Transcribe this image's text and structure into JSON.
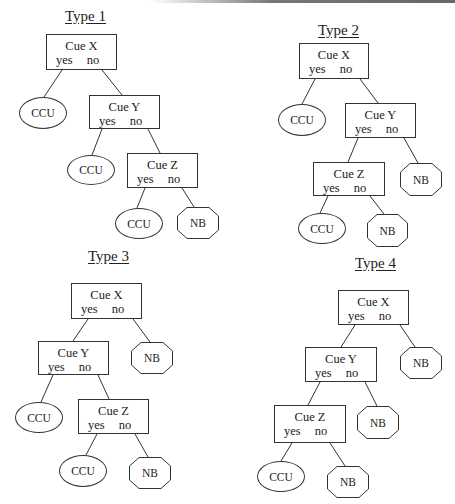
{
  "trees": [
    {
      "title": "Type 1",
      "nodes": {
        "x": {
          "cue": "Cue X",
          "yes": "yes",
          "no": "no"
        },
        "y": {
          "cue": "Cue Y",
          "yes": "yes",
          "no": "no"
        },
        "z": {
          "cue": "Cue Z",
          "yes": "yes",
          "no": "no"
        }
      },
      "leaves": {
        "x_yes": "CCU",
        "y_yes": "CCU",
        "z_yes": "CCU",
        "z_no": "NB"
      }
    },
    {
      "title": "Type 2",
      "nodes": {
        "x": {
          "cue": "Cue X",
          "yes": "yes",
          "no": "no"
        },
        "y": {
          "cue": "Cue Y",
          "yes": "yes",
          "no": "no"
        },
        "z": {
          "cue": "Cue Z",
          "yes": "yes",
          "no": "no"
        }
      },
      "leaves": {
        "x_yes": "CCU",
        "y_no": "NB",
        "z_yes": "CCU",
        "z_no": "NB"
      }
    },
    {
      "title": "Type 3",
      "nodes": {
        "x": {
          "cue": "Cue X",
          "yes": "yes",
          "no": "no"
        },
        "y": {
          "cue": "Cue Y",
          "yes": "yes",
          "no": "no"
        },
        "z": {
          "cue": "Cue Z",
          "yes": "yes",
          "no": "no"
        }
      },
      "leaves": {
        "x_no": "NB",
        "y_yes": "CCU",
        "z_yes": "CCU",
        "z_no": "NB"
      }
    },
    {
      "title": "Type 4",
      "nodes": {
        "x": {
          "cue": "Cue X",
          "yes": "yes",
          "no": "no"
        },
        "y": {
          "cue": "Cue Y",
          "yes": "yes",
          "no": "no"
        },
        "z": {
          "cue": "Cue Z",
          "yes": "yes",
          "no": "no"
        }
      },
      "leaves": {
        "x_no": "NB",
        "y_no": "NB",
        "z_yes": "CCU",
        "z_no": "NB"
      }
    }
  ],
  "legend_shapes": {
    "CCU": "ellipse",
    "NB": "octagon"
  }
}
